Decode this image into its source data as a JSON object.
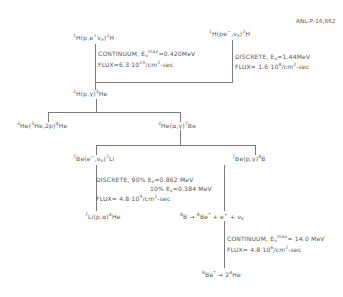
{
  "report_id": "ANL-P-16,862",
  "reactions": {
    "pp": {
      "pre": "1",
      "main": "H(p,e",
      "sup1": "+",
      "mid": "ν",
      "sub1": "e",
      "close": ")",
      "sup2": "2",
      "end": "H"
    },
    "pep": {
      "pre": "1",
      "main": "H(pe",
      "sup1": "−",
      "mid": ",ν",
      "sub1": "e",
      "close": ")",
      "sup2": "2",
      "end": "H"
    },
    "h2": {
      "pre": "2",
      "main": "H(p,γ)",
      "sup": "3",
      "end": "He"
    },
    "he3he3": {
      "pre": "3",
      "main": "He(",
      "sup": "3",
      "mid": "He,2p)",
      "sup2": "4",
      "end": "He"
    },
    "he3he4": {
      "pre": "3",
      "main": "He(α,γ)",
      "sup": "7",
      "end": "Be"
    },
    "be7e": {
      "pre": "7",
      "main": "Be(e",
      "sup1": "−",
      "mid": ",ν",
      "sub1": "e",
      "close": ")",
      "sup2": "7",
      "end": "Li"
    },
    "be7p": {
      "pre": "7",
      "main": "Be(p,γ)",
      "sup": "8",
      "end": "B"
    },
    "li7": {
      "pre": "7",
      "main": "Li(p,α)",
      "sup": "4",
      "end": "He"
    },
    "b8decay": {
      "pre": "8",
      "main": "B",
      "arrow": "→",
      "pre2": "8",
      "main2": "Be",
      "star": "*",
      "rest": "+ e",
      "sup": "+",
      "rest2": "+ ν",
      "sub": "e"
    },
    "be8decay": {
      "pre": "8",
      "main": "Be",
      "star": "*",
      "arrow": "→",
      "rest": "2",
      "sup": "4",
      "end": "He"
    }
  },
  "annotations": {
    "pp": {
      "line1_a": "CONTINUUM,  E",
      "line1_sup": "max",
      "line1_sub": "ν",
      "line1_b": "=0.420MeV",
      "line2_a": "FLUX=6.3·10",
      "line2_sup": "10",
      "line2_b": "/cm",
      "line2_sup2": "2",
      "line2_c": "-sec"
    },
    "pep": {
      "line1_a": "DISCRETE,  E",
      "line1_sub": "ν",
      "line1_b": "=1.44MeV",
      "line2_a": "FLUX= 1.6·10",
      "line2_sup": "8",
      "line2_b": "/cm",
      "line2_sup2": "2",
      "line2_c": "-sec"
    },
    "be7": {
      "line1_a": "DISCRETE, 90%  E",
      "line1_sub": "ν",
      "line1_b": "=0.862 MeV",
      "line2_a": "10%  E",
      "line2_sub": "ν",
      "line2_b": "=0.384 MeV",
      "line3_a": "FLUX= 4.8·10",
      "line3_sup": "9",
      "line3_b": "/cm",
      "line3_sup2": "2",
      "line3_c": "-sec"
    },
    "b8": {
      "line1_a": "CONTINUUM,  E",
      "line1_sup": "max",
      "line1_sub": "ν",
      "line1_b": "= 14.0 MeV",
      "line2_a": "FLUX= 4.8·10",
      "line2_sup": "6",
      "line2_b": "/cm",
      "line2_sup2": "2",
      "line2_c": "-sec"
    }
  }
}
